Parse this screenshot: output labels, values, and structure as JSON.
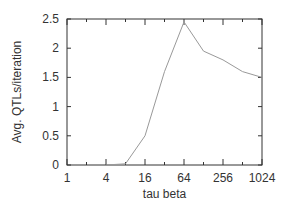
{
  "chart_data": {
    "type": "line",
    "title": "",
    "xlabel": "tau beta",
    "ylabel": "Avg. QTLs/iteration",
    "xscale": "log2",
    "xlim": [
      1,
      1024
    ],
    "ylim": [
      0,
      2.5
    ],
    "x_ticks": [
      1,
      2,
      4,
      8,
      16,
      32,
      64,
      128,
      256,
      512,
      1024
    ],
    "x_tick_labels": [
      "1",
      "4",
      "16",
      "64",
      "256",
      "1024"
    ],
    "x_tick_label_values": [
      1,
      4,
      16,
      64,
      256,
      1024
    ],
    "y_ticks": [
      0,
      0.5,
      1,
      1.5,
      2,
      2.5
    ],
    "y_tick_labels": [
      "0",
      "0.5",
      "1",
      "1.5",
      "2",
      "2.5"
    ],
    "grid": false,
    "legend": null,
    "series": [
      {
        "name": "Avg. QTLs/iteration",
        "color": "#999999",
        "x": [
          4,
          8,
          16,
          32,
          64,
          128,
          256,
          512,
          1024
        ],
        "values": [
          0.0,
          0.02,
          0.5,
          1.6,
          2.45,
          1.95,
          1.8,
          1.6,
          1.5
        ]
      }
    ]
  },
  "colors": {
    "axis": "#333333",
    "line": "#999999",
    "background": "#ffffff"
  }
}
